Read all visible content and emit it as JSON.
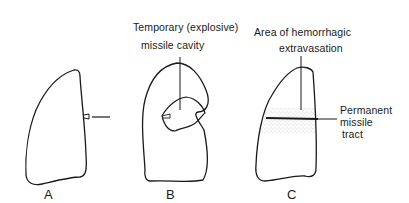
{
  "figure": {
    "panels": [
      {
        "id": "A",
        "letter": "A",
        "description": "Lung with small entry wound; missile approaching from right"
      },
      {
        "id": "B",
        "letter": "B",
        "label_line1": "Temporary (explosive)",
        "label_line2": "missile cavity"
      },
      {
        "id": "C",
        "letter": "C",
        "label_top_line1": "Area of hemorrhagic",
        "label_top_line2": "extravasation",
        "label_side_line1": "Permanent",
        "label_side_line2": "missile",
        "label_side_line3": "tract"
      }
    ],
    "colors": {
      "line": "#1a1a1a",
      "stipple": "#8a8a8a",
      "background": "#ffffff"
    }
  }
}
